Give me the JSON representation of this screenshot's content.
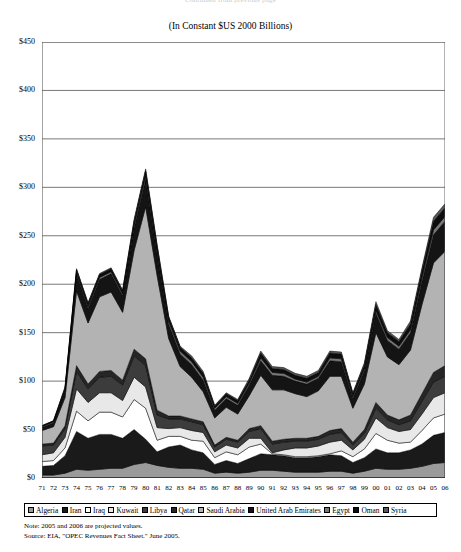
{
  "header": {
    "clipped_text": "Continued from previous page"
  },
  "chart_title": "(In Constant $US 2000 Billions)",
  "legend": {
    "items": [
      {
        "label": "Algeria",
        "color": "#9a9a9a",
        "pattern": "solid"
      },
      {
        "label": "Iran",
        "color": "#1a1a1a",
        "pattern": "solid"
      },
      {
        "label": "Iraq",
        "color": "#ffffff",
        "pattern": "solid"
      },
      {
        "label": "Kuwait",
        "color": "#e8e8e8",
        "pattern": "solid"
      },
      {
        "label": "Libya",
        "color": "#3c3c3c",
        "pattern": "solid"
      },
      {
        "label": "Qatar",
        "color": "#262626",
        "pattern": "solid"
      },
      {
        "label": "Saudi Arabia",
        "color": "#b3b3b3",
        "pattern": "solid"
      },
      {
        "label": "United Arab Emirates",
        "color": "#141414",
        "pattern": "solid"
      },
      {
        "label": "Egypt",
        "color": "#787878",
        "pattern": "solid"
      },
      {
        "label": "Oman",
        "color": "#0d0d0d",
        "pattern": "solid"
      },
      {
        "label": "Syria",
        "color": "#5a5a5a",
        "pattern": "solid"
      }
    ]
  },
  "footnotes": [
    "Note: 2005 and 2006 are projected values.",
    "Source: EIA, \"OPEC Revenues Fact Sheet.\" June 2005."
  ],
  "chart_data": {
    "type": "area",
    "stacked": true,
    "title": "(In Constant $US 2000 Billions)",
    "xlabel": "",
    "ylabel": "",
    "ylim": [
      0,
      450
    ],
    "ytick_step": 50,
    "ytick_labels": [
      "$0",
      "$50",
      "$100",
      "$150",
      "$200",
      "$250",
      "$300",
      "$350",
      "$400",
      "$450"
    ],
    "ytick_values": [
      0,
      50,
      100,
      150,
      200,
      250,
      300,
      350,
      400,
      450
    ],
    "grid": true,
    "legend_position": "bottom",
    "x": [
      "71",
      "72",
      "73",
      "74",
      "75",
      "76",
      "77",
      "78",
      "79",
      "80",
      "81",
      "82",
      "83",
      "84",
      "85",
      "86",
      "87",
      "88",
      "89",
      "90",
      "91",
      "92",
      "93",
      "94",
      "95",
      "96",
      "97",
      "98",
      "99",
      "00",
      "01",
      "02",
      "03",
      "04",
      "05",
      "06"
    ],
    "x_full_years": [
      1971,
      1972,
      1973,
      1974,
      1975,
      1976,
      1977,
      1978,
      1979,
      1980,
      1981,
      1982,
      1983,
      1984,
      1985,
      1986,
      1987,
      1988,
      1989,
      1990,
      1991,
      1992,
      1993,
      1994,
      1995,
      1996,
      1997,
      1998,
      1999,
      2000,
      2001,
      2002,
      2003,
      2004,
      2005,
      2006
    ],
    "series": [
      {
        "name": "Algeria",
        "values": [
          3,
          3,
          5,
          9,
          8,
          9,
          10,
          10,
          14,
          16,
          13,
          11,
          10,
          10,
          9,
          5,
          6,
          5,
          6,
          8,
          8,
          7,
          6,
          6,
          6,
          7,
          7,
          5,
          7,
          10,
          9,
          9,
          10,
          12,
          15,
          16
        ]
      },
      {
        "name": "Iran",
        "values": [
          9,
          10,
          18,
          39,
          33,
          36,
          35,
          31,
          36,
          24,
          14,
          21,
          24,
          19,
          17,
          9,
          12,
          10,
          14,
          17,
          16,
          16,
          15,
          15,
          16,
          17,
          16,
          11,
          14,
          20,
          17,
          17,
          19,
          23,
          29,
          31
        ]
      },
      {
        "name": "Iraq",
        "values": [
          5,
          5,
          8,
          21,
          18,
          23,
          23,
          22,
          31,
          32,
          12,
          11,
          9,
          10,
          12,
          7,
          9,
          9,
          12,
          10,
          1,
          1,
          1,
          1,
          1,
          1,
          5,
          6,
          9,
          16,
          13,
          10,
          8,
          14,
          18,
          19
        ]
      },
      {
        "name": "Kuwait",
        "values": [
          7,
          8,
          11,
          23,
          19,
          20,
          20,
          17,
          23,
          22,
          13,
          8,
          9,
          10,
          9,
          6,
          7,
          7,
          9,
          6,
          1,
          5,
          9,
          9,
          10,
          12,
          11,
          7,
          10,
          16,
          13,
          12,
          13,
          17,
          21,
          22
        ]
      },
      {
        "name": "Libya",
        "values": [
          9,
          8,
          9,
          18,
          14,
          16,
          17,
          16,
          22,
          22,
          13,
          10,
          9,
          9,
          8,
          5,
          6,
          6,
          7,
          10,
          9,
          8,
          7,
          7,
          7,
          8,
          8,
          5,
          6,
          10,
          8,
          7,
          9,
          13,
          16,
          17
        ]
      },
      {
        "name": "Qatar",
        "values": [
          2,
          2,
          3,
          6,
          5,
          6,
          6,
          5,
          7,
          7,
          5,
          3,
          3,
          3,
          3,
          2,
          2,
          2,
          3,
          3,
          3,
          3,
          3,
          3,
          3,
          4,
          4,
          3,
          4,
          6,
          5,
          5,
          6,
          8,
          10,
          11
        ]
      },
      {
        "name": "Saudi Arabia",
        "values": [
          14,
          17,
          29,
          77,
          63,
          77,
          81,
          70,
          102,
          157,
          139,
          80,
          51,
          43,
          31,
          28,
          31,
          27,
          34,
          52,
          53,
          51,
          46,
          43,
          47,
          56,
          54,
          35,
          47,
          72,
          60,
          57,
          67,
          92,
          113,
          118
        ]
      },
      {
        "name": "United Arab Emirates",
        "values": [
          3,
          4,
          7,
          17,
          15,
          18,
          19,
          17,
          23,
          28,
          22,
          15,
          13,
          13,
          12,
          8,
          9,
          9,
          11,
          15,
          15,
          14,
          13,
          13,
          13,
          16,
          15,
          10,
          14,
          20,
          17,
          16,
          18,
          24,
          29,
          31
        ]
      },
      {
        "name": "Egypt",
        "values": [
          1,
          1,
          1,
          2,
          2,
          2,
          2,
          2,
          3,
          4,
          3,
          3,
          3,
          3,
          3,
          2,
          2,
          2,
          2,
          3,
          3,
          3,
          2,
          2,
          2,
          3,
          3,
          2,
          2,
          3,
          3,
          3,
          3,
          4,
          5,
          5
        ]
      },
      {
        "name": "Oman",
        "values": [
          1,
          1,
          2,
          3,
          3,
          3,
          3,
          3,
          4,
          5,
          5,
          4,
          4,
          4,
          4,
          2,
          3,
          3,
          3,
          5,
          4,
          4,
          4,
          4,
          4,
          5,
          5,
          3,
          4,
          6,
          5,
          5,
          6,
          7,
          9,
          9
        ]
      },
      {
        "name": "Syria",
        "values": [
          0,
          0,
          1,
          1,
          1,
          1,
          1,
          1,
          2,
          2,
          2,
          1,
          1,
          2,
          2,
          1,
          1,
          1,
          2,
          2,
          2,
          2,
          2,
          2,
          2,
          2,
          2,
          1,
          2,
          3,
          2,
          2,
          3,
          3,
          4,
          4
        ]
      }
    ],
    "totals": [
      54,
      59,
      94,
      216,
      181,
      211,
      217,
      194,
      247,
      319,
      241,
      167,
      136,
      126,
      110,
      75,
      88,
      81,
      103,
      131,
      115,
      114,
      108,
      105,
      111,
      131,
      130,
      88,
      119,
      182,
      152,
      143,
      162,
      217,
      269,
      283
    ],
    "annotations": {
      "peak_year": "80",
      "peak_value": 428,
      "peak_note": "1980 peak above $400 billion"
    }
  }
}
